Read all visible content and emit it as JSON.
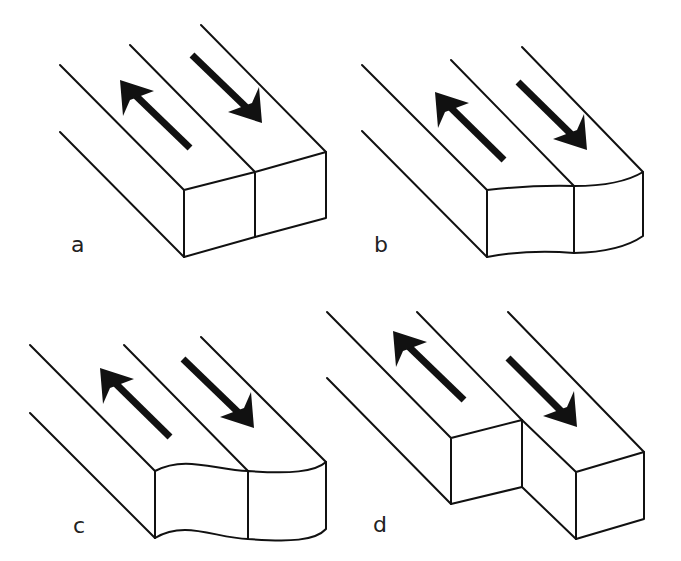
{
  "figure": {
    "colors": {
      "line": "#111111",
      "background": "#ffffff",
      "arrow": "#111111"
    },
    "panels": [
      {
        "label": "a",
        "front_face": "straight",
        "offset": false,
        "arrows": [
          "up-left",
          "down-right"
        ]
      },
      {
        "label": "b",
        "front_face": "curved",
        "offset": false,
        "arrows": [
          "up-left",
          "down-right"
        ]
      },
      {
        "label": "c",
        "front_face": "wavy",
        "offset": false,
        "arrows": [
          "up-left",
          "down-right"
        ]
      },
      {
        "label": "d",
        "front_face": "straight",
        "offset": true,
        "arrows": [
          "up-left",
          "down-right"
        ]
      }
    ]
  }
}
